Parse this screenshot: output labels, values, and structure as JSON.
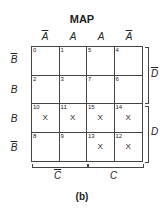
{
  "title": "MAP",
  "caption": "(b)",
  "columns": [
    {
      "label": "A",
      "bar": true
    },
    {
      "label": "A",
      "bar": false
    },
    {
      "label": "A",
      "bar": false
    },
    {
      "label": "A",
      "bar": true
    }
  ],
  "rows": [
    {
      "label": "B",
      "bar": true
    },
    {
      "label": "B",
      "bar": false
    },
    {
      "label": "B",
      "bar": false
    },
    {
      "label": "B",
      "bar": true
    }
  ],
  "cells": [
    {
      "n": "0",
      "x": ""
    },
    {
      "n": "1",
      "x": ""
    },
    {
      "n": "5",
      "x": ""
    },
    {
      "n": "4",
      "x": ""
    },
    {
      "n": "2",
      "x": ""
    },
    {
      "n": "3",
      "x": ""
    },
    {
      "n": "7",
      "x": ""
    },
    {
      "n": "6",
      "x": ""
    },
    {
      "n": "10",
      "x": "X"
    },
    {
      "n": "11",
      "x": "X"
    },
    {
      "n": "15",
      "x": "X"
    },
    {
      "n": "14",
      "x": "X"
    },
    {
      "n": "8",
      "x": ""
    },
    {
      "n": "9",
      "x": ""
    },
    {
      "n": "13",
      "x": "X"
    },
    {
      "n": "12",
      "x": "X"
    }
  ],
  "right_labels": {
    "top": "D",
    "bottom": "D"
  },
  "bottom_labels": {
    "left": "C",
    "right": "C"
  }
}
